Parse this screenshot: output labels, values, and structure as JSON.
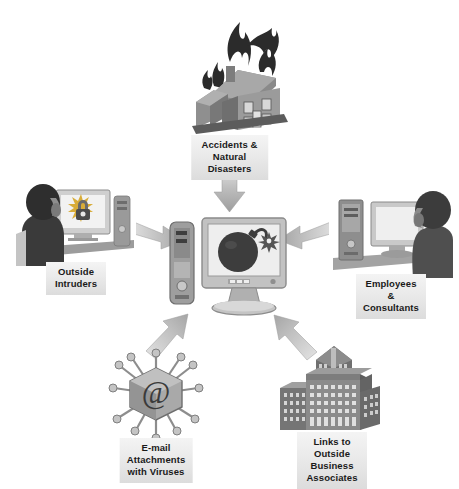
{
  "diagram": {
    "background_color": "#ffffff",
    "label_bg_color": "#e9e9e9",
    "label_text_color": "#1a1a1a",
    "arrow_color": "#b5b5b5",
    "center": {
      "name": "central-computer-system",
      "icon": "computer-with-bomb-icon",
      "description": "Desktop computer tower and monitor displaying a lit bomb"
    },
    "threats": [
      {
        "id": "accidents",
        "label": "Accidents &\nNatural Disasters",
        "icon": "burning-house-icon",
        "position": "top",
        "arrow_direction": "down"
      },
      {
        "id": "intruders",
        "label": "Outside Intruders",
        "icon": "hacker-at-computer-icon",
        "position": "left",
        "arrow_direction": "right"
      },
      {
        "id": "employees",
        "label": "Employees &\nConsultants",
        "icon": "employee-at-computer-icon",
        "position": "right",
        "arrow_direction": "left"
      },
      {
        "id": "email",
        "label": "E-mail Attachments\nwith Viruses",
        "icon": "email-virus-icon",
        "position": "bottom-left",
        "arrow_direction": "up-right"
      },
      {
        "id": "links",
        "label": "Links to Outside\nBusiness Associates",
        "icon": "office-buildings-icon",
        "position": "bottom-right",
        "arrow_direction": "up-left"
      }
    ]
  }
}
